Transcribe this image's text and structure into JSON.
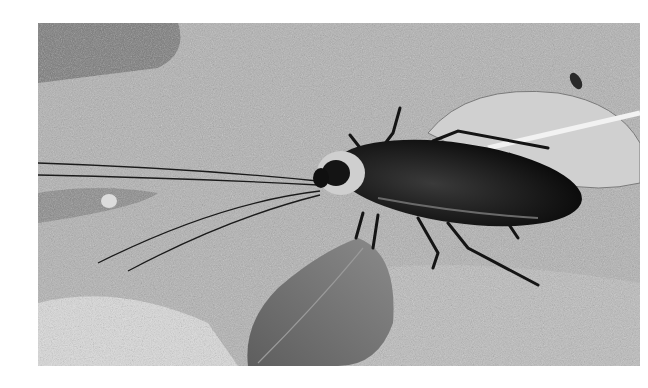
{
  "image": {
    "description": "Grayscale photograph of a large cockroach with long antennae resting on a rough concrete surface next to dry leaves",
    "colors": {
      "background": "#ffffff",
      "concrete": "#b4b4b4",
      "insect": "#141414",
      "leaf_dark": "#6e6e6e",
      "leaf_light": "#cfcfcf"
    }
  }
}
